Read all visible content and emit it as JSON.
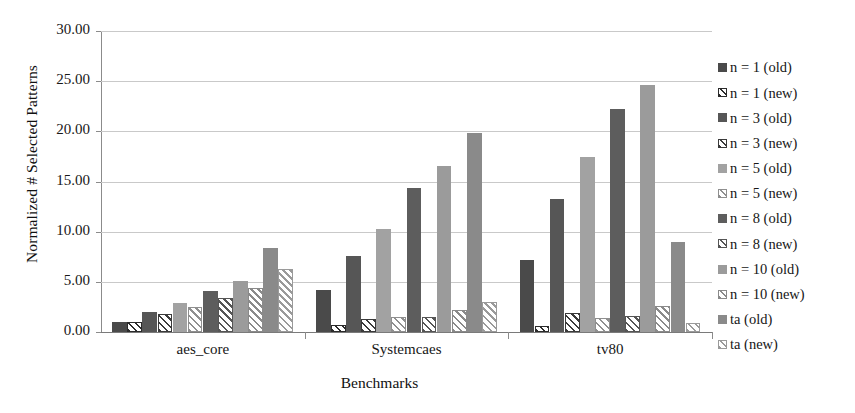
{
  "chart_data": {
    "type": "bar",
    "title": "",
    "xlabel": "Benchmarks",
    "ylabel": "Normalized # Selected Patterns",
    "categories": [
      "aes_core",
      "Systemcaes",
      "tv80"
    ],
    "ylim": [
      0,
      30
    ],
    "yticks": [
      0,
      5,
      10,
      15,
      20,
      25,
      30
    ],
    "ytick_labels": [
      "0.00",
      "5.00",
      "10.00",
      "15.00",
      "20.00",
      "25.00",
      "30.00"
    ],
    "grid": true,
    "legend_position": "right",
    "series": [
      {
        "name": "n = 1 (old)",
        "fill": "solid",
        "color": "#4a4a4a",
        "values": [
          0.95,
          4.2,
          7.2
        ]
      },
      {
        "name": "n = 1 (new)",
        "fill": "hatch",
        "color": "#2b2b2b",
        "values": [
          0.95,
          0.7,
          0.6
        ]
      },
      {
        "name": "n = 3 (old)",
        "fill": "solid",
        "color": "#565656",
        "values": [
          2.0,
          7.6,
          13.3
        ]
      },
      {
        "name": "n = 3 (new)",
        "fill": "hatch",
        "color": "#3a3a3a",
        "values": [
          1.8,
          1.3,
          1.9
        ]
      },
      {
        "name": "n = 5 (old)",
        "fill": "solid",
        "color": "#a2a2a2",
        "values": [
          2.9,
          10.3,
          17.4
        ]
      },
      {
        "name": "n = 5 (new)",
        "fill": "hatch",
        "color": "#8f8f8f",
        "values": [
          2.5,
          1.5,
          1.4
        ]
      },
      {
        "name": "n = 8 (old)",
        "fill": "solid",
        "color": "#5d5d5d",
        "values": [
          4.1,
          14.4,
          22.2
        ]
      },
      {
        "name": "n = 8 (new)",
        "fill": "hatch",
        "color": "#555555",
        "values": [
          3.4,
          1.5,
          1.6
        ]
      },
      {
        "name": "n = 10 (old)",
        "fill": "solid",
        "color": "#9b9b9b",
        "values": [
          5.1,
          16.5,
          24.6
        ]
      },
      {
        "name": "n = 10 (new)",
        "fill": "hatch",
        "color": "#8a8a8a",
        "values": [
          4.4,
          2.2,
          2.6
        ]
      },
      {
        "name": "ta (old)",
        "fill": "solid",
        "color": "#8a8a8a",
        "values": [
          8.4,
          19.8,
          9.0
        ]
      },
      {
        "name": "ta (new)",
        "fill": "hatch",
        "color": "#9a9a9a",
        "values": [
          6.3,
          3.0,
          0.9
        ]
      }
    ]
  },
  "legend": {
    "items": [
      {
        "label": "n = 1 (old)"
      },
      {
        "label": "n = 1 (new)"
      },
      {
        "label": "n = 3 (old)"
      },
      {
        "label": "n = 3 (new)"
      },
      {
        "label": "n = 5 (old)"
      },
      {
        "label": "n = 5 (new)"
      },
      {
        "label": "n = 8 (old)"
      },
      {
        "label": "n = 8 (new)"
      },
      {
        "label": "n = 10 (old)"
      },
      {
        "label": "n = 10 (new)"
      },
      {
        "label": "ta (old)"
      },
      {
        "label": "ta (new)"
      }
    ]
  },
  "axes": {
    "y_title": "Normalized # Selected Patterns",
    "x_title": "Benchmarks",
    "y_tick_labels": [
      "30.00",
      "25.00",
      "20.00",
      "15.00",
      "10.00",
      "5.00",
      "0.00"
    ],
    "x_tick_labels": [
      "aes_core",
      "Systemcaes",
      "tv80"
    ]
  },
  "colors": {
    "grid": "#c9c9c9",
    "axis": "#8b8b8b",
    "text": "#161616",
    "background": "#ffffff"
  }
}
